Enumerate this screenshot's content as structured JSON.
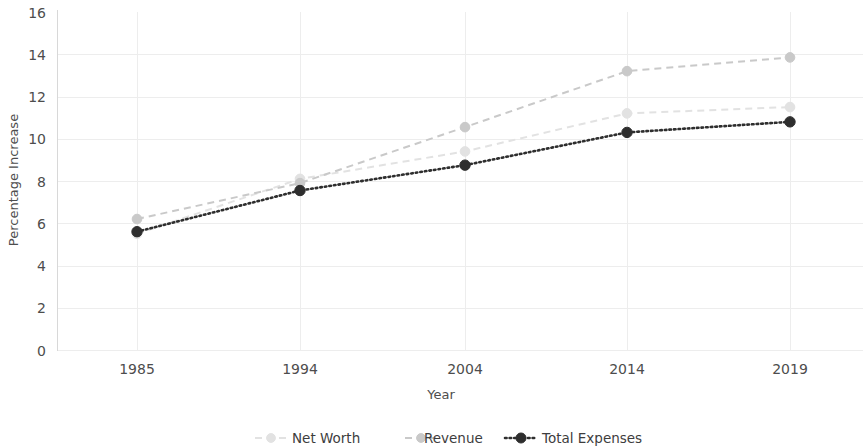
{
  "chart_data": {
    "type": "line",
    "title": "",
    "xlabel": "Year",
    "ylabel": "Percentage Increase",
    "categories": [
      "1985",
      "1994",
      "2004",
      "2014",
      "2019"
    ],
    "x": [
      1985,
      1994,
      2004,
      2014,
      2019
    ],
    "ylim": [
      0,
      16
    ],
    "yticks": [
      0,
      2,
      4,
      6,
      8,
      10,
      12,
      14,
      16
    ],
    "ytick_labels": [
      "0",
      "2",
      "4",
      "6",
      "8",
      "10",
      "12",
      "14",
      "16"
    ],
    "grid": true,
    "legend_position": "bottom",
    "series": [
      {
        "name": "Net Worth",
        "values": [
          5.5,
          8.1,
          9.4,
          11.2,
          11.5
        ],
        "color": "#e2e2e2",
        "linestyle": "dashed",
        "marker": "circle"
      },
      {
        "name": "Revenue",
        "values": [
          6.2,
          7.9,
          10.55,
          13.2,
          13.85
        ],
        "color": "#c9c9c9",
        "linestyle": "dashed",
        "marker": "circle"
      },
      {
        "name": "Total Expenses",
        "values": [
          5.6,
          7.55,
          8.75,
          10.3,
          10.8
        ],
        "color": "#2e2e2e",
        "linestyle": "dotted",
        "marker": "circle-filled"
      }
    ]
  },
  "axes": {
    "ylabel": "Percentage Increase",
    "xlabel": "Year"
  },
  "legend": {
    "items": [
      {
        "label": "Net Worth"
      },
      {
        "label": "Revenue"
      },
      {
        "label": "Total Expenses"
      }
    ]
  },
  "colors": {
    "background": "#ffffff",
    "grid": "#ededed",
    "spine": "#d8d8d8",
    "text": "#4d4d4d",
    "net_worth": "#e2e2e2",
    "revenue": "#c9c9c9",
    "total_expenses": "#2e2e2e"
  }
}
